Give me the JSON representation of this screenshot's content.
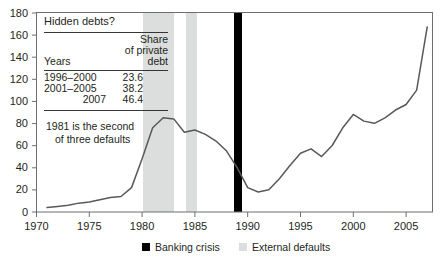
{
  "chart_data": {
    "type": "line",
    "title": "",
    "xlabel": "",
    "ylabel": "",
    "xlim": [
      1970,
      2007.5
    ],
    "ylim": [
      0,
      180
    ],
    "grid": false,
    "legend_position": "bottom-center",
    "x_ticks": [
      "1970",
      "1975",
      "1980",
      "1985",
      "1990",
      "1995",
      "2000",
      "2005"
    ],
    "x_tick_values": [
      1970,
      1975,
      1980,
      1985,
      1990,
      1995,
      2000,
      2005
    ],
    "y_ticks": [
      "0",
      "20",
      "40",
      "60",
      "80",
      "100",
      "120",
      "140",
      "160",
      "180"
    ],
    "y_tick_values": [
      0,
      20,
      40,
      60,
      80,
      100,
      120,
      140,
      160,
      180
    ],
    "series": [
      {
        "name": "Total debt",
        "color": "#58595b",
        "x": [
          1971,
          1972,
          1973,
          1974,
          1975,
          1976,
          1977,
          1978,
          1979,
          1980,
          1981,
          1982,
          1983,
          1984,
          1985,
          1986,
          1987,
          1988,
          1989,
          1990,
          1991,
          1992,
          1993,
          1994,
          1995,
          1996,
          1997,
          1998,
          1999,
          2000,
          2001,
          2002,
          2003,
          2004,
          2005,
          2006,
          2007
        ],
        "values": [
          4,
          5,
          6,
          8,
          9,
          11,
          13,
          14,
          22,
          48,
          76,
          85,
          84,
          72,
          74,
          70,
          64,
          55,
          40,
          22,
          18,
          20,
          30,
          42,
          53,
          57,
          50,
          60,
          76,
          88,
          82,
          80,
          85,
          92,
          97,
          110,
          167
        ]
      }
    ],
    "shaded_bands": [
      {
        "label": "External defaults",
        "start": 1981.0,
        "end": 1984.0,
        "color": "#dcdddd"
      },
      {
        "label": "External defaults",
        "start": 1986.3,
        "end": 1987.3,
        "color": "#dcdddd"
      }
    ],
    "vertical_markers": [
      {
        "label": "Banking crisis",
        "year": 1990,
        "color": "#000000"
      }
    ],
    "legend": [
      {
        "label": "Banking crisis",
        "color": "#000000"
      },
      {
        "label": "External defaults",
        "color": "#dcdddd"
      }
    ],
    "inset_table": {
      "title": "Hidden debts?",
      "columns": [
        "Years",
        "Share of private debt"
      ],
      "column_header_lines": [
        [
          "Years"
        ],
        [
          "Share",
          "of private",
          "debt"
        ]
      ],
      "rows": [
        {
          "years": "1996–2000",
          "share": "23.6"
        },
        {
          "years": "2001–2005",
          "share": "38.2"
        },
        {
          "years": "2007",
          "share": "46.4"
        }
      ]
    },
    "annotations": [
      {
        "name": "default-note",
        "lines": [
          "1981 is the second",
          "of three defaults"
        ]
      }
    ]
  }
}
